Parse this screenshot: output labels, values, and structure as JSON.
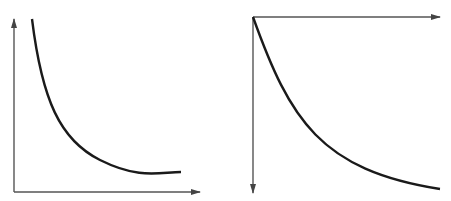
{
  "figure": {
    "panels": [
      {
        "id": "left",
        "description": "Decreasing convex curve approaching horizontal asymptote; standard axes (y up, x right)",
        "axes": {
          "color": "#555555",
          "y_axis": {
            "x": 14,
            "y_top": 19,
            "y_bottom": 192,
            "arrow": "up"
          },
          "x_axis": {
            "y": 192,
            "x_left": 14,
            "x_right": 200,
            "arrow": "right"
          }
        },
        "curve": {
          "color": "#1a1a1a",
          "width": 2.4,
          "path": "M 32 19 C 42 100, 60 140, 100 160 S 160 172, 181 172"
        }
      },
      {
        "id": "right",
        "description": "Exponential decay curve from origin; x-axis on top pointing right, y-axis pointing down",
        "axes": {
          "color": "#555555",
          "x_axis": {
            "y": 17,
            "x_left": 253,
            "x_right": 440,
            "arrow": "right"
          },
          "y_axis": {
            "x": 253,
            "y_top": 17,
            "y_bottom": 193,
            "arrow": "down"
          }
        },
        "curve": {
          "color": "#1a1a1a",
          "width": 2.4,
          "path": "M 253 17 C 290 120, 320 170, 440 189"
        }
      }
    ]
  }
}
